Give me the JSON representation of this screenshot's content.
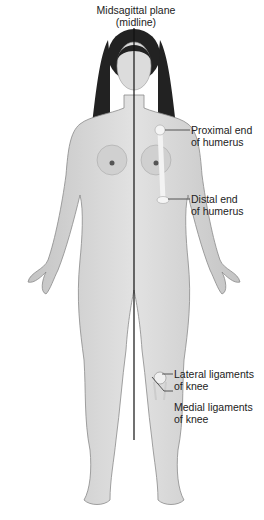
{
  "diagram": {
    "title_label": {
      "line1": "Midsagittal plane",
      "line2": "(midline)"
    },
    "labels": [
      {
        "id": "proximal-humerus",
        "line1": "Proximal end",
        "line2": "of humerus"
      },
      {
        "id": "distal-humerus",
        "line1": "Distal end",
        "line2": "of humerus"
      },
      {
        "id": "lateral-ligaments",
        "line1": "Lateral ligaments",
        "line2": "of knee"
      },
      {
        "id": "medial-ligaments",
        "line1": "Medial ligaments",
        "line2": "of knee"
      }
    ],
    "colors": {
      "skin": "#d9d9d9",
      "skin_shadow": "#b5b5b5",
      "hair": "#1e1e1e",
      "line": "#111111",
      "bone": "#f0f0f0"
    }
  }
}
